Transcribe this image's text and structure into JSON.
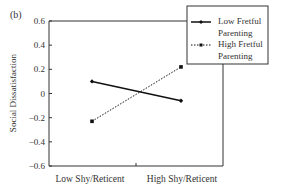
{
  "panel_label": "(b)",
  "chart_data": {
    "type": "line",
    "title": "",
    "xlabel": "",
    "ylabel": "Social Dissatisfaction",
    "ylim": [
      -0.6,
      0.6
    ],
    "yticks": [
      "0.6",
      "0.4",
      "0.2",
      "0",
      "−0.2",
      "−0.4",
      "−0.6"
    ],
    "categories": [
      "Low Shy/Reticent",
      "High Shy/Reticent"
    ],
    "grid": false,
    "legend_position": "upper right (outside top-right corner)",
    "series": [
      {
        "name": "Low Fretful Parenting",
        "legend_lines": [
          "Low Fretful",
          "Parenting"
        ],
        "style": "solid",
        "marker": "diamond",
        "values": [
          0.1,
          -0.06
        ]
      },
      {
        "name": "High Fretful Parenting",
        "legend_lines": [
          "High Fretful",
          "Parenting"
        ],
        "style": "dotted",
        "marker": "square",
        "values": [
          -0.23,
          0.22
        ]
      }
    ]
  },
  "colors": {
    "line": "#111111",
    "axis": "#333333",
    "text": "#333333"
  }
}
